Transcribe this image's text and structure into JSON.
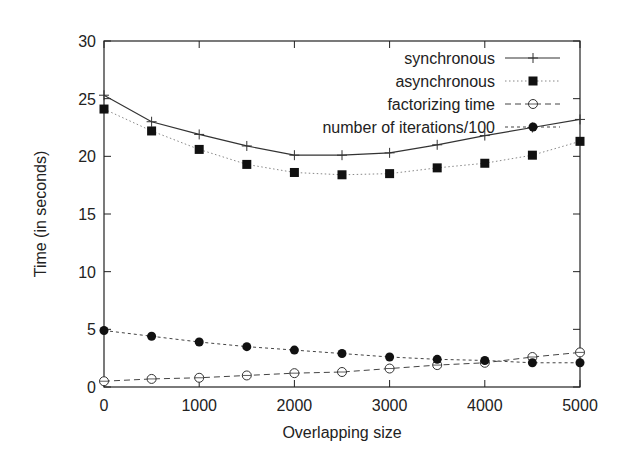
{
  "chart_data": {
    "type": "line",
    "title": "",
    "xlabel": "Overlapping size",
    "ylabel": "Time (in seconds)",
    "xlim": [
      0,
      5000
    ],
    "ylim": [
      0,
      30
    ],
    "grid": false,
    "legend_position": "top-right (inside)",
    "x_ticks": [
      0,
      1000,
      2000,
      3000,
      4000,
      5000
    ],
    "y_ticks": [
      0,
      5,
      10,
      15,
      20,
      25,
      30
    ],
    "x": [
      0,
      500,
      1000,
      1500,
      2000,
      2500,
      3000,
      3500,
      4000,
      4500,
      5000
    ],
    "series": [
      {
        "name": "synchronous",
        "style": "solid",
        "marker": "plus",
        "values": [
          25.3,
          23.0,
          21.9,
          20.9,
          20.1,
          20.1,
          20.3,
          21.0,
          21.8,
          22.5,
          23.2
        ]
      },
      {
        "name": "asynchronous",
        "style": "dotted",
        "marker": "filled-square",
        "values": [
          24.1,
          22.2,
          20.6,
          19.3,
          18.6,
          18.4,
          18.5,
          19.0,
          19.4,
          20.1,
          21.3
        ]
      },
      {
        "name": "factorizing time",
        "style": "dashed",
        "marker": "open-circle",
        "values": [
          0.5,
          0.7,
          0.8,
          1.0,
          1.2,
          1.3,
          1.6,
          1.9,
          2.1,
          2.6,
          3.0
        ]
      },
      {
        "name": "number of iterations/100",
        "style": "short-dashed",
        "marker": "filled-circle",
        "values": [
          4.9,
          4.4,
          3.9,
          3.5,
          3.2,
          2.9,
          2.6,
          2.4,
          2.3,
          2.1,
          2.1
        ]
      }
    ]
  },
  "colors": {
    "axis": "#222222",
    "line": "#333333",
    "dotted": "#888888",
    "marker": "#111111"
  }
}
